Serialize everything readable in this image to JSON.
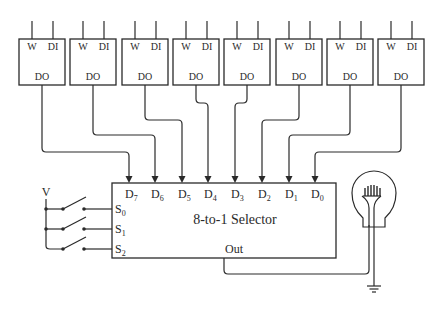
{
  "diagram": {
    "type": "circuit",
    "colors": {
      "line": "#2a2a2a",
      "background": "#ffffff"
    },
    "memory_cells": [
      {
        "id": 7,
        "labels": {
          "write": "W",
          "data_in": "DI",
          "data_out": "DO"
        },
        "connects_to": "D7"
      },
      {
        "id": 6,
        "labels": {
          "write": "W",
          "data_in": "DI",
          "data_out": "DO"
        },
        "connects_to": "D6"
      },
      {
        "id": 5,
        "labels": {
          "write": "W",
          "data_in": "DI",
          "data_out": "DO"
        },
        "connects_to": "D5"
      },
      {
        "id": 4,
        "labels": {
          "write": "W",
          "data_in": "DI",
          "data_out": "DO"
        },
        "connects_to": "D4"
      },
      {
        "id": 3,
        "labels": {
          "write": "W",
          "data_in": "DI",
          "data_out": "DO"
        },
        "connects_to": "D3"
      },
      {
        "id": 2,
        "labels": {
          "write": "W",
          "data_in": "DI",
          "data_out": "DO"
        },
        "connects_to": "D2"
      },
      {
        "id": 1,
        "labels": {
          "write": "W",
          "data_in": "DI",
          "data_out": "DO"
        },
        "connects_to": "D1"
      },
      {
        "id": 0,
        "labels": {
          "write": "W",
          "data_in": "DI",
          "data_out": "DO"
        },
        "connects_to": "D0"
      }
    ],
    "selector": {
      "title": "8-to-1 Selector",
      "data_inputs": [
        {
          "base": "D",
          "sub": "7"
        },
        {
          "base": "D",
          "sub": "6"
        },
        {
          "base": "D",
          "sub": "5"
        },
        {
          "base": "D",
          "sub": "4"
        },
        {
          "base": "D",
          "sub": "3"
        },
        {
          "base": "D",
          "sub": "2"
        },
        {
          "base": "D",
          "sub": "1"
        },
        {
          "base": "D",
          "sub": "0"
        }
      ],
      "select_inputs": [
        {
          "base": "S",
          "sub": "0"
        },
        {
          "base": "S",
          "sub": "1"
        },
        {
          "base": "S",
          "sub": "2"
        }
      ],
      "output": "Out"
    },
    "voltage_label": "V",
    "switches": 3,
    "output_device": "light-bulb",
    "ground": "ground-symbol"
  }
}
